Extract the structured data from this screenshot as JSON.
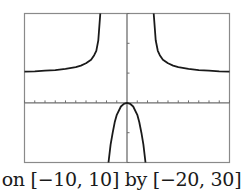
{
  "caption": "on [−10, 10] by [−20, 30]",
  "colors": {
    "frame": "#8a8a8a",
    "axis": "#6e6e6e",
    "curve": "#1a1a1a",
    "background": "#ffffff"
  },
  "chart_data": {
    "type": "line",
    "title": "",
    "xlabel": "",
    "ylabel": "",
    "xlim": [
      -10,
      10
    ],
    "ylim": [
      -20,
      30
    ],
    "x_tick_step": 1,
    "y_tick_step": 10,
    "grid": false,
    "legend": null,
    "annotation": "on [−10, 10] by [−20, 30]",
    "vertical_asymptotes": [
      -2.2,
      2.2
    ],
    "horizontal_asymptote": 10,
    "series": [
      {
        "name": "left-upper-branch",
        "x": [
          -10,
          -9,
          -8,
          -7,
          -6,
          -5,
          -4.5,
          -4,
          -3.5,
          -3.2,
          -3,
          -2.8,
          -2.6
        ],
        "y": [
          10.5,
          10.6,
          10.8,
          11.0,
          11.4,
          12.0,
          12.5,
          13.3,
          14.5,
          16.0,
          17.5,
          21.0,
          30
        ]
      },
      {
        "name": "middle-branch",
        "x": [
          -1.8,
          -1.6,
          -1.4,
          -1.2,
          -1.0,
          -0.6,
          -0.3,
          0,
          0.3,
          0.6,
          1.0,
          1.2,
          1.4,
          1.6,
          1.8
        ],
        "y": [
          -20,
          -14,
          -10,
          -6.5,
          -4.0,
          -1.2,
          -0.3,
          0,
          -0.3,
          -1.2,
          -4.0,
          -6.5,
          -10,
          -14,
          -20
        ]
      },
      {
        "name": "right-upper-branch",
        "x": [
          2.6,
          2.8,
          3,
          3.2,
          3.5,
          4,
          4.5,
          5,
          6,
          7,
          8,
          9,
          10
        ],
        "y": [
          30,
          21.0,
          17.5,
          16.0,
          14.5,
          13.3,
          12.5,
          12.0,
          11.4,
          11.0,
          10.8,
          10.6,
          10.5
        ]
      }
    ]
  }
}
